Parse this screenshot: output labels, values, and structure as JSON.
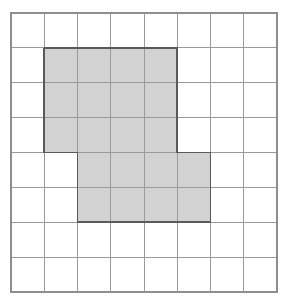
{
  "chart_data": {
    "type": "heatmap",
    "xlabel": "",
    "ylabel": "",
    "grid": true,
    "legend": null,
    "columns": 8,
    "rows": 8,
    "x": [
      0,
      1,
      2,
      3,
      4,
      5,
      6,
      7
    ],
    "y": [
      0,
      1,
      2,
      3,
      4,
      5,
      6,
      7
    ],
    "categories": [
      "col0",
      "col1",
      "col2",
      "col3",
      "col4",
      "col5",
      "col6",
      "col7"
    ],
    "values": [
      [
        0,
        0,
        0,
        0,
        0,
        0,
        0,
        0
      ],
      [
        0,
        1,
        1,
        1,
        1,
        0,
        0,
        0
      ],
      [
        0,
        1,
        1,
        1,
        1,
        0,
        0,
        0
      ],
      [
        0,
        1,
        1,
        1,
        1,
        0,
        0,
        0
      ],
      [
        0,
        0,
        1,
        1,
        1,
        1,
        0,
        0
      ],
      [
        0,
        0,
        1,
        1,
        1,
        1,
        0,
        0
      ],
      [
        0,
        0,
        0,
        0,
        0,
        0,
        0,
        0
      ],
      [
        0,
        0,
        0,
        0,
        0,
        0,
        0,
        0
      ]
    ],
    "shaded_cell_count": 20,
    "unshaded_cell_count": 44,
    "total_cell_count": 64,
    "shaded_blocks": [
      {
        "name": "upper-block",
        "col_start": 1,
        "col_end": 5,
        "row_start": 1,
        "row_end": 4,
        "cells": 12
      },
      {
        "name": "lower-block",
        "col_start": 2,
        "col_end": 6,
        "row_start": 4,
        "row_end": 6,
        "cells": 8
      }
    ],
    "shaded_cells": [
      [
        1,
        1
      ],
      [
        2,
        1
      ],
      [
        3,
        1
      ],
      [
        4,
        1
      ],
      [
        1,
        2
      ],
      [
        2,
        2
      ],
      [
        3,
        2
      ],
      [
        4,
        2
      ],
      [
        1,
        3
      ],
      [
        2,
        3
      ],
      [
        3,
        3
      ],
      [
        4,
        3
      ],
      [
        2,
        4
      ],
      [
        3,
        4
      ],
      [
        4,
        4
      ],
      [
        5,
        4
      ],
      [
        2,
        5
      ],
      [
        3,
        5
      ],
      [
        4,
        5
      ],
      [
        5,
        5
      ]
    ],
    "outline_path_cells": "1,1 5,1 5,4 6,4 6,6 2,6 2,4 1,4 1,1",
    "xlim": [
      0,
      8
    ],
    "ylim": [
      0,
      8
    ]
  },
  "geometry": {
    "origin_x": 11,
    "origin_y": 13,
    "cell_width": 33.25,
    "cell_height": 34.875
  },
  "colors": {
    "background": "#ffffff",
    "grid_line": "#9a9a9a",
    "grid_border": "#8e8e8e",
    "shade_fill": "#d2d2d2",
    "shape_outline": "#5a5a5a"
  }
}
